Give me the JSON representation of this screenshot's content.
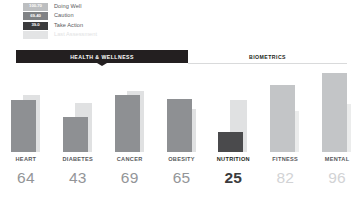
{
  "legend": {
    "items": [
      {
        "range": "100-70",
        "label": "Doing Well",
        "tone": "well"
      },
      {
        "range": "69-40",
        "label": "Caution",
        "tone": "caution"
      },
      {
        "range": "39-0",
        "label": "Take Action",
        "tone": "action"
      },
      {
        "range": "",
        "label": "Last Assessment",
        "tone": "last"
      }
    ]
  },
  "tabs": [
    {
      "label": "HEALTH & WELLNESS",
      "active": true
    },
    {
      "label": "BIOMETRICS",
      "active": false
    }
  ],
  "chart_data": {
    "type": "bar",
    "title": "",
    "xlabel": "",
    "ylabel": "",
    "ylim": [
      0,
      100
    ],
    "grid": false,
    "legend_position": "top-left",
    "categories": [
      "HEART",
      "DIABETES",
      "CANCER",
      "OBESITY",
      "NUTRITION",
      "FITNESS",
      "MENTAL"
    ],
    "series": [
      {
        "name": "Current",
        "values": [
          64,
          43,
          69,
          65,
          25,
          82,
          96
        ]
      },
      {
        "name": "Last Assessment",
        "values": [
          70,
          60,
          75,
          52,
          63,
          50,
          58
        ]
      }
    ],
    "value_labels": [
      "64",
      "43",
      "69",
      "65",
      "25",
      "82",
      "96"
    ],
    "tones": [
      "caution",
      "caution",
      "caution",
      "caution",
      "action",
      "muted",
      "muted"
    ]
  },
  "colors": {
    "doing_well": "#bcbec0",
    "caution": "#808285",
    "take_action": "#3b3b3d",
    "last_assessment": "#e0e1e2",
    "tab_active_bg": "#231f20",
    "value_text": "#939598"
  }
}
